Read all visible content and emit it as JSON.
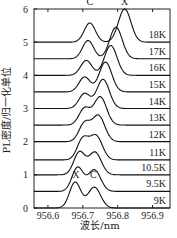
{
  "chart_data": {
    "type": "line",
    "title": "",
    "xlabel": "波长/nm",
    "ylabel": "PL密度/归一化单位",
    "xlim": [
      956.56,
      956.95
    ],
    "ylim": [
      0,
      6
    ],
    "xticks": [
      956.6,
      956.7,
      956.8,
      956.9
    ],
    "yticks": [
      0,
      1,
      2,
      3,
      4,
      5,
      6
    ],
    "grid": false,
    "peak_labels": [
      {
        "text": "X",
        "curve": "9K",
        "x": 956.68
      },
      {
        "text": "C",
        "curve": "9K",
        "x": 956.73
      },
      {
        "text": "C",
        "curve": "18K",
        "x": 956.72
      },
      {
        "text": "X",
        "curve": "18K",
        "x": 956.82
      }
    ],
    "series": [
      {
        "name": "9K",
        "offset": 0.0,
        "x_peak": 956.678,
        "c_peak": 956.733,
        "x_amp": 0.78,
        "c_amp": 0.63
      },
      {
        "name": "9.5K",
        "offset": 0.5,
        "x_peak": 956.685,
        "c_peak": 956.733,
        "x_amp": 0.72,
        "c_amp": 0.65
      },
      {
        "name": "10.5K",
        "offset": 1.0,
        "x_peak": 956.69,
        "c_peak": 956.735,
        "x_amp": 0.68,
        "c_amp": 0.68
      },
      {
        "name": "11K",
        "offset": 1.45,
        "x_peak": 956.7,
        "c_peak": 956.738,
        "x_amp": 0.62,
        "c_amp": 0.72
      },
      {
        "name": "12K",
        "offset": 2.0,
        "x_peak": 956.705,
        "c_peak": 956.745,
        "x_amp": 0.55,
        "c_amp": 0.78
      },
      {
        "name": "13K",
        "offset": 2.5,
        "x_peak": 956.705,
        "c_peak": 956.75,
        "x_amp": 0.5,
        "c_amp": 0.85
      },
      {
        "name": "14K",
        "offset": 3.0,
        "x_peak": 956.705,
        "c_peak": 956.758,
        "x_amp": 0.45,
        "c_amp": 0.88
      },
      {
        "name": "15K",
        "offset": 3.5,
        "x_peak": 956.705,
        "c_peak": 956.765,
        "x_amp": 0.45,
        "c_amp": 0.9
      },
      {
        "name": "16K",
        "offset": 4.0,
        "x_peak": 956.71,
        "c_peak": 956.78,
        "x_amp": 0.45,
        "c_amp": 0.9
      },
      {
        "name": "17K",
        "offset": 4.5,
        "x_peak": 956.715,
        "c_peak": 956.795,
        "x_amp": 0.55,
        "c_amp": 0.95
      },
      {
        "name": "18K",
        "offset": 5.0,
        "x_peak": 956.72,
        "c_peak": 956.82,
        "x_amp": 0.58,
        "c_amp": 1.0
      }
    ]
  },
  "caption": "图 不同温度下的量子点光致发光谱"
}
